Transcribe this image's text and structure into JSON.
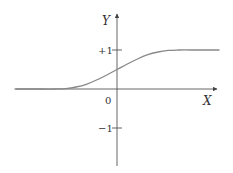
{
  "chart_data": {
    "type": "line",
    "title": "",
    "xlabel": "X",
    "ylabel": "Y",
    "origin_label": "0",
    "y_ticks": [
      {
        "value": 1,
        "label": "+1"
      },
      {
        "value": -1,
        "label": "−1"
      }
    ],
    "x_ticks": [],
    "grid": false,
    "legend": null,
    "ylim": [
      -1.9,
      2.1
    ],
    "xlim": [
      -5.2,
      5.2
    ],
    "series": [
      {
        "name": "sigmoid",
        "description": "S-shaped curve rising from 0 to +1, passing through 0.5 at X=0",
        "x": [
          -5.0,
          -4.0,
          -3.0,
          -2.5,
          -2.0,
          -1.5,
          -1.0,
          -0.5,
          0.0,
          0.5,
          1.0,
          1.5,
          2.0,
          2.5,
          3.0,
          4.0,
          5.0
        ],
        "values": [
          0.0,
          0.0,
          0.0,
          0.01,
          0.05,
          0.12,
          0.23,
          0.36,
          0.5,
          0.64,
          0.77,
          0.88,
          0.95,
          0.99,
          1.0,
          1.0,
          1.0
        ]
      }
    ],
    "colors": {
      "axis": "#555555",
      "curve": "#888888",
      "text": "#333333"
    }
  }
}
